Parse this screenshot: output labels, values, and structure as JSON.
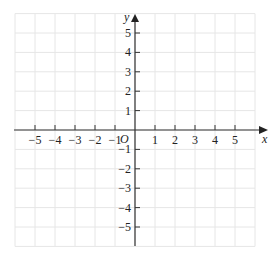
{
  "diagram": {
    "type": "cartesian-coordinate-grid",
    "x_axis": {
      "label": "x",
      "min": -6,
      "max": 6,
      "tick_labels": [
        "-5",
        "-4",
        "-3",
        "-2",
        "-1",
        "1",
        "2",
        "3",
        "4",
        "5"
      ],
      "tick_values": [
        -5,
        -4,
        -3,
        -2,
        -1,
        1,
        2,
        3,
        4,
        5
      ]
    },
    "y_axis": {
      "label": "y",
      "min": -6,
      "max": 6,
      "tick_labels": [
        "5",
        "4",
        "3",
        "2",
        "1",
        "-1",
        "-2",
        "-3",
        "-4",
        "-5"
      ],
      "tick_values": [
        5,
        4,
        3,
        2,
        1,
        -1,
        -2,
        -3,
        -4,
        -5
      ]
    },
    "origin_label": "O",
    "grid": true,
    "colors": {
      "grid": "#e6e6e6",
      "axis": "#333333",
      "text": "#222222"
    }
  }
}
